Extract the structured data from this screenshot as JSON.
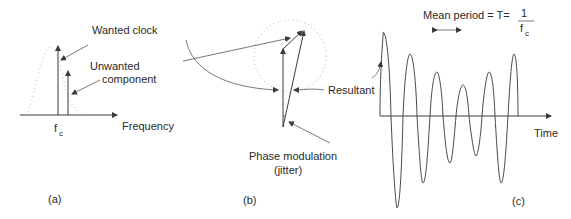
{
  "figure": {
    "panels": [
      {
        "id": "a",
        "caption": "(a)",
        "labels": {
          "wanted": "Wanted clock",
          "unwanted_line1": "Unwanted",
          "unwanted_line2": "component",
          "fc_main": "f",
          "fc_sub": "c",
          "xaxis": "Frequency"
        }
      },
      {
        "id": "b",
        "caption": "(b)",
        "labels": {
          "resultant": "Resultant",
          "phase_line1": "Phase  modulation",
          "phase_line2": "(jitter)"
        }
      },
      {
        "id": "c",
        "caption": "(c)",
        "labels": {
          "mean_period": "Mean period = T=",
          "frac_num": "1",
          "frac_den_main": "f",
          "frac_den_sub": "c",
          "xaxis": "Time"
        }
      }
    ]
  },
  "colors": {
    "line": "#3a3a3a",
    "dotted": "#c8c8c8",
    "text": "#2a2a2a",
    "background": "#ffffff"
  }
}
